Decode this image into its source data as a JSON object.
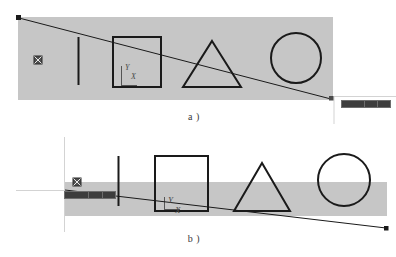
{
  "figure": {
    "width": 396,
    "height": 257,
    "background": "#ffffff",
    "ground_color": "#c6c6c6",
    "ink_color": "#1a1a1a",
    "guide_color": "#bfbfbf"
  },
  "panels": [
    {
      "id": "a",
      "caption": "a )",
      "ground": {
        "x": 18,
        "y": 17,
        "width": 315,
        "height": 83
      },
      "sight_line": {
        "start": {
          "x": 19,
          "y": 18
        },
        "end": {
          "x": 331,
          "y": 99
        },
        "start_marker": "square",
        "end_marker": "square"
      },
      "objects": [
        {
          "name": "target-marker",
          "shape": "crossed-square",
          "x": 37,
          "y": 59,
          "size": 8
        },
        {
          "name": "vertical-bar",
          "shape": "line",
          "x": 78,
          "y1": 37,
          "y2": 85
        },
        {
          "name": "square",
          "shape": "rect",
          "x": 113,
          "y": 37,
          "width": 48,
          "height": 50
        },
        {
          "name": "axis-gizmo",
          "shape": "axis",
          "x": 121,
          "y": 70
        },
        {
          "name": "triangle",
          "shape": "triangle",
          "cx": 212,
          "base_y": 87,
          "half_width": 29,
          "apex_y": 41
        },
        {
          "name": "circle",
          "shape": "circle",
          "cx": 296,
          "cy": 58,
          "r": 25
        }
      ],
      "guide_lines": [
        {
          "orientation": "vertical",
          "x": 334,
          "y1": 97,
          "y2": 124
        },
        {
          "orientation": "horizontal",
          "x1": 334,
          "x2": 396,
          "y": 97
        }
      ],
      "toolbar": {
        "cells": [
          "",
          "",
          ""
        ]
      }
    },
    {
      "id": "b",
      "caption": "b )",
      "ground": {
        "x": 65,
        "y": 182,
        "width": 322,
        "height": 34
      },
      "sight_line": {
        "start": {
          "x": 65,
          "y": 190
        },
        "end": {
          "x": 386,
          "y": 228
        },
        "start_marker": "none",
        "end_marker": "square"
      },
      "objects": [
        {
          "name": "target-marker",
          "shape": "crossed-square",
          "x": 76,
          "y": 180,
          "size": 8
        },
        {
          "name": "vertical-bar",
          "shape": "line",
          "x": 118,
          "y1": 156,
          "y2": 206
        },
        {
          "name": "square",
          "shape": "rect",
          "x": 155,
          "y": 156,
          "width": 53,
          "height": 55
        },
        {
          "name": "axis-gizmo",
          "shape": "axis",
          "x": 164,
          "y": 202
        },
        {
          "name": "triangle",
          "shape": "triangle",
          "cx": 262,
          "base_y": 211,
          "half_width": 28,
          "apex_y": 163
        },
        {
          "name": "circle",
          "shape": "circle",
          "cx": 344,
          "cy": 180,
          "r": 26
        }
      ],
      "guide_lines": [
        {
          "orientation": "vertical",
          "x": 64,
          "y1": 137,
          "y2": 232
        },
        {
          "orientation": "horizontal",
          "x1": 16,
          "x2": 110,
          "y": 190
        }
      ],
      "toolbar": {
        "cells": [
          "",
          "",
          ""
        ]
      }
    }
  ],
  "labels": {
    "axis_y": "Y",
    "axis_x": "X"
  }
}
